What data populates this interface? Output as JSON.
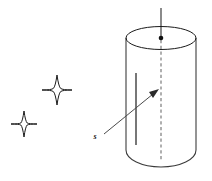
{
  "figure": {
    "background_color": "#ffffff",
    "line_color": "#1a1a1a",
    "labels": {
      "spin_vector": "s"
    },
    "elements": {
      "cylinder_name": "cylinder",
      "top_ellipse_name": "cylinder-top-ellipse",
      "axis_name": "rotation-axis",
      "center_dot_name": "axis-center-point",
      "inner_line_name": "cylinder-inner-line",
      "arrow_name": "spin-vector-arrow",
      "star_upper_name": "star-upper",
      "star_lower_name": "star-lower"
    },
    "geometry": {
      "cylinder_left_x": 126,
      "cylinder_right_x": 196,
      "top_ellipse_center_y": 38,
      "top_ellipse_rx": 35,
      "top_ellipse_ry": 11.5,
      "cylinder_bottom_y": 150,
      "bottom_arc_depth": 17,
      "axis_top_y": 8,
      "axis_bottom_y": 161,
      "axis_x": 161,
      "inner_line_x": 136,
      "inner_line_top_y": 73,
      "inner_line_bottom_y": 145,
      "arrow_tail_x": 104,
      "arrow_tail_y": 134,
      "arrow_tip_x": 158,
      "arrow_tip_y": 90,
      "label_s_x": 96,
      "label_s_y": 136,
      "star_upper_cx": 57,
      "star_upper_cy": 90,
      "star_upper_r_long": 15,
      "star_upper_r_short": 3.6,
      "star_lower_cx": 24,
      "star_lower_cy": 124,
      "star_lower_r_long": 13,
      "star_lower_r_short": 3.2
    }
  }
}
